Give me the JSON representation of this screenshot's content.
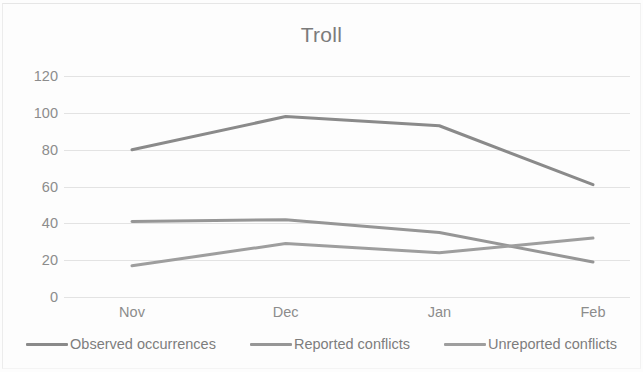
{
  "chart_data": {
    "type": "line",
    "title": "Troll",
    "xlabel": "",
    "ylabel": "",
    "categories": [
      "Nov",
      "Dec",
      "Jan",
      "Feb"
    ],
    "series": [
      {
        "name": "Observed occurrences",
        "values": [
          80,
          98,
          93,
          61
        ],
        "color": "#8a8a8a"
      },
      {
        "name": "Reported conflicts",
        "values": [
          41,
          42,
          35,
          19
        ],
        "color": "#969696"
      },
      {
        "name": "Unreported conflicts",
        "values": [
          17,
          29,
          24,
          32
        ],
        "color": "#9e9e9e"
      }
    ],
    "ylim": [
      0,
      120
    ],
    "yticks": [
      0,
      20,
      40,
      60,
      80,
      100,
      120
    ],
    "ytick_labels": [
      "0",
      "20",
      "40",
      "60",
      "80",
      "100",
      "120"
    ],
    "grid": true,
    "grid_color": "#e3e3e3",
    "legend_position": "bottom",
    "axis_label_color": "#8c8c8c",
    "title_color": "#7b7b7b",
    "background": "#fdfdfd"
  }
}
